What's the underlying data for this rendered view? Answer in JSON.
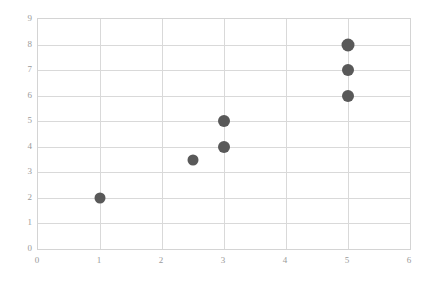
{
  "chart_data": {
    "type": "scatter",
    "title": "",
    "subtitle": "",
    "xlabel": "",
    "ylabel": "",
    "xlim": [
      0,
      6
    ],
    "ylim": [
      0,
      9
    ],
    "grid": true,
    "legend": null,
    "x_ticks": [
      "0",
      "1",
      "2",
      "3",
      "4",
      "5",
      "6"
    ],
    "x_tick_values": [
      0,
      1,
      2,
      3,
      4,
      5,
      6
    ],
    "y_ticks": [
      "0",
      "1",
      "2",
      "3",
      "4",
      "5",
      "6",
      "7",
      "8",
      "9"
    ],
    "y_tick_values": [
      0,
      1,
      2,
      3,
      4,
      5,
      6,
      7,
      8,
      9
    ],
    "points": [
      {
        "x": 1,
        "y": 2,
        "size": 11
      },
      {
        "x": 2.5,
        "y": 3.5,
        "size": 11
      },
      {
        "x": 3,
        "y": 4,
        "size": 12
      },
      {
        "x": 3,
        "y": 5,
        "size": 12
      },
      {
        "x": 5,
        "y": 6,
        "size": 12
      },
      {
        "x": 5,
        "y": 7,
        "size": 12
      },
      {
        "x": 5,
        "y": 8,
        "size": 13
      }
    ],
    "series": [
      {
        "name": "series-1",
        "color": "#595959",
        "x": [
          1,
          2.5,
          3,
          3,
          5,
          5,
          5
        ],
        "values": [
          2,
          3.5,
          4,
          5,
          6,
          7,
          8
        ]
      }
    ]
  },
  "style": {
    "point_color": "#595959",
    "gridline_color": "#d9d9d9",
    "axis_border_color": "#d4d4d4",
    "tick_label_color": "#9a9a9a",
    "background_color": "#ffffff"
  }
}
